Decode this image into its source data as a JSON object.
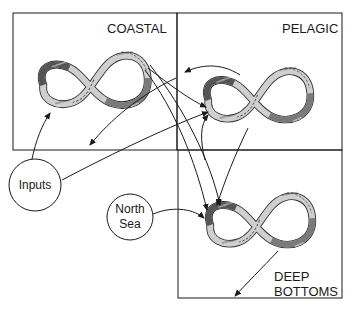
{
  "regions": [
    {
      "id": "coastal",
      "label": "COASTAL"
    },
    {
      "id": "pelagic",
      "label": "PELAGIC"
    },
    {
      "id": "deep",
      "label": "DEEP",
      "label2": "BOTTOMS"
    }
  ],
  "nodes": {
    "inputs": {
      "label": "Inputs"
    },
    "north_sea": {
      "line1": "North",
      "line2": "Sea"
    }
  },
  "cycle_phases": {
    "reorganization": "reorganization",
    "exploitation": "exploitation",
    "conservation": "conservation",
    "release": "release"
  },
  "colors": {
    "line": "#1a1a1a",
    "band_light": "#d8d8d8",
    "band_dark": "#555555",
    "band_mid": "#8a8a8a"
  }
}
